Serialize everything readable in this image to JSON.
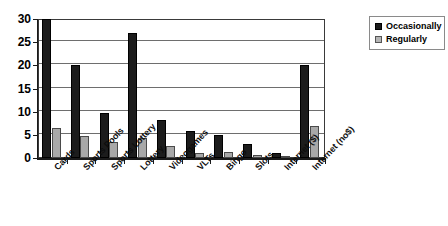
{
  "chart_data": {
    "type": "bar",
    "title": "",
    "subtitle": "",
    "xlabel": "",
    "ylabel": "",
    "ylim": [
      0,
      30
    ],
    "yticks": [
      0,
      5,
      10,
      15,
      20,
      25,
      30
    ],
    "grid": true,
    "legend_position": "top-right-outside",
    "orientation": "vertical",
    "grouping": "grouped",
    "categories": [
      "Cards",
      "Sports Pools",
      "Sports Lottery",
      "Lottery",
      "Videogames",
      "VLTs",
      "Bingo",
      "Slots",
      "Internet ($)",
      "Internet (no$)"
    ],
    "series": [
      {
        "name": "Occasionally",
        "color": "#1c1c1c",
        "values": [
          30,
          20,
          9.8,
          27,
          8.3,
          5.8,
          5.0,
          3.0,
          1.0,
          20
        ]
      },
      {
        "name": "Regularly",
        "color": "#a8a8a8",
        "values": [
          6.5,
          4.8,
          3.5,
          4.4,
          2.5,
          1.0,
          1.2,
          0.6,
          0.3,
          7.0
        ]
      }
    ]
  },
  "legend": {
    "items": [
      {
        "label": "Occasionally",
        "swatch": "black-square-swatch"
      },
      {
        "label": "Regularly",
        "swatch": "gray-square-swatch"
      }
    ]
  }
}
